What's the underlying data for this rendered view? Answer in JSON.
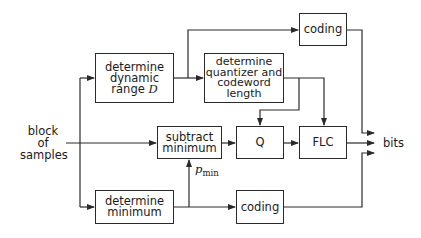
{
  "diagram": {
    "input": {
      "lines": [
        "block",
        "of",
        "samples"
      ]
    },
    "output": {
      "label": "bits"
    },
    "blocks": {
      "dynamic_range": {
        "lines": [
          "determine",
          "dynamic",
          "range"
        ],
        "symbol": "D"
      },
      "coding_top": {
        "label": "coding"
      },
      "quantizer": {
        "lines": [
          "determine",
          "quantizer and",
          "codeword",
          "length"
        ]
      },
      "subtract_min": {
        "lines": [
          "subtract",
          "minimum"
        ]
      },
      "q": {
        "label": "Q"
      },
      "flc": {
        "label": "FLC"
      },
      "determine_min": {
        "lines": [
          "determine",
          "minimum"
        ]
      },
      "coding_bottom": {
        "label": "coding"
      }
    },
    "signal_label": {
      "symbol": "p",
      "subscript": "min"
    }
  }
}
